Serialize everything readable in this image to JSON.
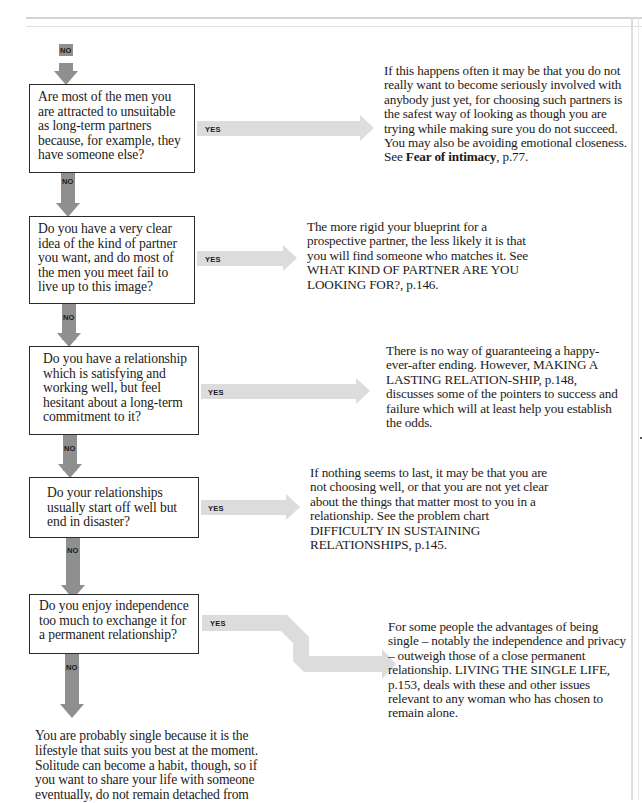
{
  "flowchart": {
    "entry_label": "NO",
    "branch_yes_label": "YES",
    "branch_no_label": "NO",
    "questions": [
      {
        "id": "q1",
        "text": "Are most of the men you are attracted to unsuitable as long-term partners because, for example, they have someone else?",
        "yes_answer": {
          "text": "If this happens often it may be that you do not really want to become seriously involved with anybody just yet, for choosing such partners is the safest way of looking as though you are trying while making sure you do not succeed. You may also be avoiding emotional closeness. See",
          "ref_bold": "Fear of intimacy",
          "ref_tail": ", p.77."
        }
      },
      {
        "id": "q2",
        "text": "Do you have a very clear idea of the kind of partner you want, and do most of the men you meet fail to live up to this image?",
        "yes_answer": {
          "text": "The more rigid your blueprint for a prospective partner, the less likely it is that you will find someone who matches it. See WHAT KIND OF PARTNER ARE YOU LOOKING FOR?, p.146."
        }
      },
      {
        "id": "q3",
        "text": "Do you have a relationship which is satisfying and working well, but feel hesitant about a long-term commitment to it?",
        "yes_answer": {
          "text": "There is no way of guaranteeing a happy-ever-after ending. However, MAKING A LASTING RELATION-SHIP, p.148, discusses some of the pointers to success and failure which will at least help you establish the odds."
        }
      },
      {
        "id": "q4",
        "text": "Do your relationships usually start off well but end in disaster?",
        "yes_answer": {
          "text": "If nothing seems to last, it may be that you are not choosing well, or that you are not yet clear about the things that matter most to you in a relationship. See the problem chart DIFFICULTY IN SUSTAINING RELATIONSHIPS, p.145."
        }
      },
      {
        "id": "q5",
        "text": "Do you enjoy independence too much to exchange it for a permanent relationship?",
        "yes_answer": {
          "text": "For some people the advantages of being single – notably the independence and privacy – outweigh those of a close permanent relationship. LIVING THE SINGLE LIFE, p.153, deals with these and other issues relevant to any woman who has chosen to remain alone."
        }
      }
    ],
    "final_no_answer": {
      "text": "You are probably single because it is the lifestyle that suits you best at the moment. Solitude can become a habit, though, so if you want to share your life with someone eventually, do not remain detached from"
    },
    "colors": {
      "no_arrow": "#8f8f8f",
      "yes_arrow": "#dcdcdc",
      "box_border": "#2a2a2a",
      "text": "#1e1a18"
    }
  }
}
